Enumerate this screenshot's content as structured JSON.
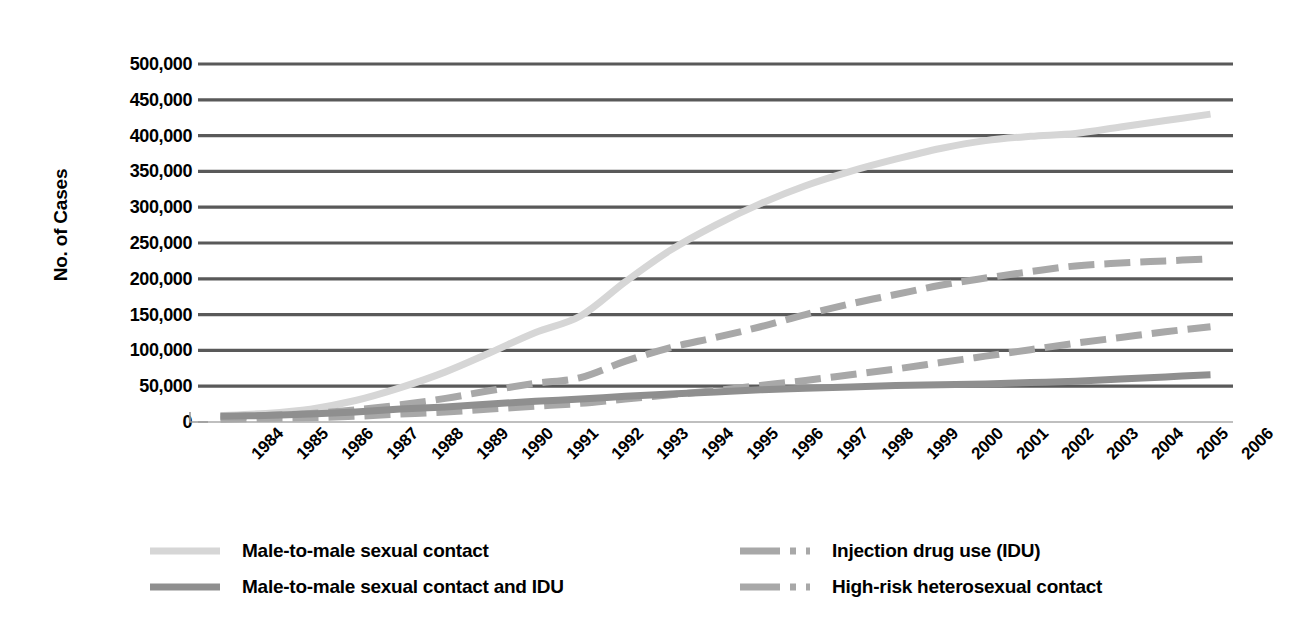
{
  "chart_data": {
    "type": "line",
    "title": "",
    "xlabel": "",
    "ylabel": "No. of Cases",
    "grid": true,
    "legend_position": "bottom",
    "ylim": [
      0,
      500000
    ],
    "ytick_step": 50000,
    "yticks": [
      "500,000",
      "450,000",
      "400,000",
      "350,000",
      "300,000",
      "250,000",
      "200,000",
      "150,000",
      "100,000",
      "50,000",
      "0"
    ],
    "ytick_values": [
      500000,
      450000,
      400000,
      350000,
      300000,
      250000,
      200000,
      150000,
      100000,
      50000,
      0
    ],
    "categories": [
      "1984",
      "1985",
      "1986",
      "1987",
      "1988",
      "1989",
      "1990",
      "1991",
      "1992",
      "1993",
      "1994",
      "1995",
      "1996",
      "1997",
      "1998",
      "1999",
      "2000",
      "2001",
      "2002",
      "2003",
      "2004",
      "2005",
      "2006"
    ],
    "series": [
      {
        "name": "Male-to-male sexual contact",
        "color": "#d6d6d6",
        "style": "solid",
        "values": [
          9000,
          12000,
          18000,
          30000,
          48000,
          70000,
          97000,
          125000,
          148000,
          196000,
          240000,
          275000,
          305000,
          330000,
          350000,
          367000,
          382000,
          393000,
          399000,
          403000,
          412000,
          421000,
          430000
        ]
      },
      {
        "name": "Male-to-male sexual contact and IDU",
        "color": "#8f8f8f",
        "style": "solid",
        "values": [
          8000,
          9000,
          11000,
          14000,
          18000,
          21000,
          25000,
          29000,
          32000,
          36000,
          39000,
          42000,
          45000,
          47000,
          49000,
          51000,
          52000,
          53000,
          55000,
          57000,
          60000,
          63000,
          66000
        ]
      },
      {
        "name": "Injection drug use (IDU)",
        "color": "#a8a8a8",
        "style": "dashed",
        "values": [
          7000,
          9000,
          12000,
          17000,
          24000,
          33000,
          44000,
          54000,
          62000,
          85000,
          104000,
          118000,
          133000,
          150000,
          165000,
          178000,
          191000,
          201000,
          210000,
          218000,
          222000,
          225000,
          228000
        ]
      },
      {
        "name": "High-risk heterosexual contact",
        "color": "#a8a8a8",
        "style": "dashed",
        "values": [
          4000,
          5000,
          6000,
          8000,
          11000,
          14000,
          18000,
          22000,
          26000,
          32000,
          38000,
          44000,
          51000,
          58000,
          66000,
          74000,
          83000,
          92000,
          101000,
          110000,
          118000,
          126000,
          133000
        ]
      }
    ]
  },
  "axis": {
    "y_title": "No. of Cases",
    "gridline_color": "#595959",
    "baseline_color": "#bfbfbf"
  },
  "legend": {
    "items": [
      {
        "label": "Male-to-male sexual contact",
        "color": "#d6d6d6",
        "style": "solid"
      },
      {
        "label": "Male-to-male sexual contact and IDU",
        "color": "#8f8f8f",
        "style": "solid"
      },
      {
        "label": "Injection drug use (IDU)",
        "color": "#a8a8a8",
        "style": "dashed"
      },
      {
        "label": "High-risk heterosexual contact",
        "color": "#a8a8a8",
        "style": "dashed"
      }
    ]
  }
}
